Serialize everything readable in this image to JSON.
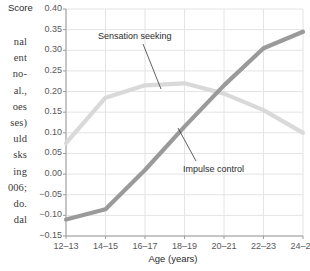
{
  "page": {
    "body_text_lines": [
      "nal",
      "ent",
      "no-",
      "al.,",
      "oes",
      "ses)",
      "uld",
      "sks",
      "ing",
      "006;",
      "do.",
      "dal"
    ],
    "bottom_clipped_line": "uld his parents"
  },
  "chart_data": {
    "type": "line",
    "title": "",
    "xlabel": "Age (years)",
    "ylabel": "Score",
    "categories": [
      "12–13",
      "14–15",
      "16–17",
      "18–19",
      "20–21",
      "22–23",
      "24–25"
    ],
    "ylim": [
      -0.15,
      0.4
    ],
    "yticks": [
      "0.40",
      "0.35",
      "0.30",
      "0.25",
      "0.20",
      "0.15",
      "0.10",
      "0.05",
      "0.00",
      "−0.05",
      "−0.10",
      "−0.15"
    ],
    "ytick_values": [
      0.4,
      0.35,
      0.3,
      0.25,
      0.2,
      0.15,
      0.1,
      0.05,
      0.0,
      -0.05,
      -0.1,
      -0.15
    ],
    "grid": true,
    "legend_position": "inline-annotations",
    "series": [
      {
        "name": "Sensation seeking",
        "color": "#d9d9d9",
        "values": [
          0.075,
          0.185,
          0.215,
          0.22,
          0.195,
          0.155,
          0.1
        ]
      },
      {
        "name": "Impulse control",
        "color": "#9a9a9a",
        "values": [
          -0.11,
          -0.085,
          0.01,
          0.115,
          0.215,
          0.305,
          0.345
        ]
      }
    ],
    "annotations": [
      {
        "name": "Sensation seeking",
        "label": "Sensation seeking"
      },
      {
        "name": "Impulse control",
        "label": "Impulse control"
      }
    ]
  }
}
